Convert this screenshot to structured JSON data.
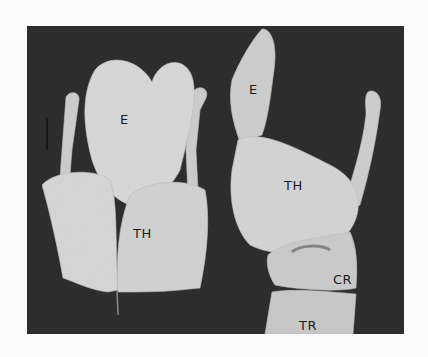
{
  "figure": {
    "background_color": "#2d2d2d",
    "page_color": "#fbfbfb",
    "specimen_color": "#d6d6d6",
    "left_view": {
      "labels": [
        {
          "text": "E",
          "x": 120,
          "y": 112
        },
        {
          "text": "TH",
          "x": 133,
          "y": 226
        }
      ]
    },
    "right_view": {
      "labels": [
        {
          "text": "E",
          "x": 249,
          "y": 82
        },
        {
          "text": "TH",
          "x": 284,
          "y": 178
        },
        {
          "text": "CR",
          "x": 333,
          "y": 272
        },
        {
          "text": "TR",
          "x": 299,
          "y": 318
        }
      ]
    }
  }
}
